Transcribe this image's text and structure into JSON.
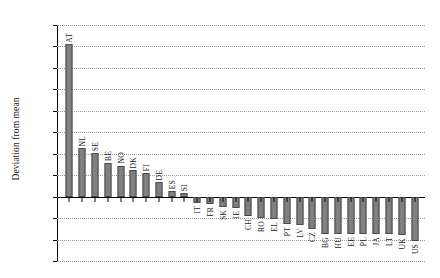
{
  "chart_data": {
    "type": "bar",
    "title": "",
    "xlabel": "",
    "ylabel": "Deviation from mean",
    "ylim": [
      -1.5,
      4.0
    ],
    "grid": true,
    "legend": "none",
    "ytick_labels": [
      "4.00",
      "3.50",
      "3.00",
      "2.50",
      "2.00",
      "1.50",
      "1.00",
      "0.50",
      "–",
      "-0.50",
      "-1.00",
      "-1.50"
    ],
    "ytick_values": [
      4.0,
      3.5,
      3.0,
      2.5,
      2.0,
      1.5,
      1.0,
      0.5,
      0.0,
      -0.5,
      -1.0,
      -1.5
    ],
    "categories": [
      "AT",
      "NL",
      "SE",
      "BE",
      "NO",
      "DK",
      "FI",
      "DE",
      "ES",
      "SI",
      "IT",
      "FR",
      "SK",
      "IE",
      "CH",
      "RO",
      "EL",
      "PT",
      "LV",
      "CZ",
      "BG",
      "HU",
      "EE",
      "PL",
      "JA",
      "LT",
      "UK",
      "US"
    ],
    "values": [
      3.55,
      1.13,
      1.02,
      0.78,
      0.72,
      0.62,
      0.55,
      0.33,
      0.13,
      0.08,
      -0.14,
      -0.17,
      -0.24,
      -0.26,
      -0.44,
      -0.5,
      -0.52,
      -0.63,
      -0.65,
      -0.76,
      -0.86,
      -0.86,
      -0.88,
      -0.88,
      -0.87,
      -0.88,
      -0.89,
      -1.03
    ],
    "bar_color": "#808080",
    "bar_edge_color": "#4a4a4a"
  }
}
